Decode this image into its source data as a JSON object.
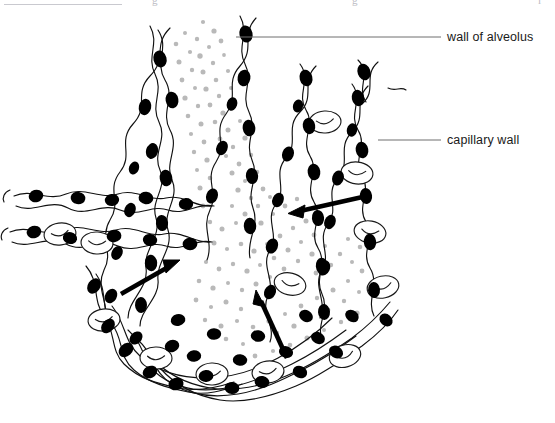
{
  "figure": {
    "kind": "biology-diagram",
    "background_color": "#ffffff",
    "ink_color": "#000000",
    "alveolar_space_dot_color": "#b9b9b9",
    "nucleus_color": "#000000",
    "rbc_outline_color": "#1a1a1a",
    "leader_line_color": "#6e6e6e"
  },
  "labels": [
    {
      "id": "wall-of-alveolus",
      "text": "wall of alveolus",
      "text_x": 447,
      "text_y": 30,
      "leader_from_x": 236,
      "leader_from_y": 37,
      "leader_to_x": 441,
      "leader_to_y": 37
    },
    {
      "id": "capillary-wall",
      "text": "capillary wall",
      "text_x": 447,
      "text_y": 133,
      "leader_from_x": 378,
      "leader_from_y": 140,
      "leader_to_x": 441,
      "leader_to_y": 140
    }
  ],
  "arrows": [
    {
      "id": "diffusion-arrow-upper-right",
      "direction": "left",
      "from_x": 367,
      "from_y": 196,
      "to_x": 292,
      "to_y": 213,
      "stroke_width": 4.5
    },
    {
      "id": "diffusion-arrow-lower-left",
      "direction": "up-right",
      "from_x": 121,
      "from_y": 294,
      "to_x": 177,
      "to_y": 262,
      "stroke_width": 4.5
    },
    {
      "id": "diffusion-arrow-bottom-center",
      "direction": "up-left",
      "from_x": 287,
      "from_y": 358,
      "to_x": 258,
      "to_y": 293,
      "stroke_width": 4.5
    }
  ],
  "top_strip": {
    "rule_visible": true,
    "fragment_a": "g",
    "fragment_b": "g",
    "fragment_c": "l"
  },
  "counts": {
    "visible_red_blood_cells": 10,
    "visible_arrows": 3,
    "visible_labels": 2
  }
}
